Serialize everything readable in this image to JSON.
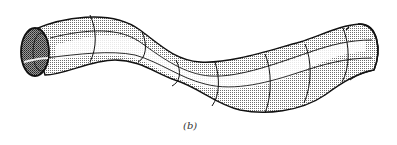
{
  "figure": {
    "caption": "(b)",
    "colors": {
      "outline": "#111111",
      "shade_dark": "#8a8a8a",
      "shade_light": "#c8c8c8",
      "highlight": "#ffffff",
      "interior": "#555555"
    }
  }
}
